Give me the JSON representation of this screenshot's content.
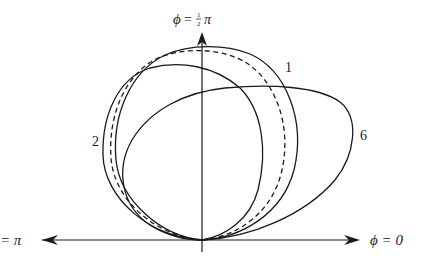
{
  "figure": {
    "type": "polar-radiation-pattern",
    "axes": {
      "vertical_label": "ϕ = ½ π",
      "vertical_label_parts": {
        "symbol": "ϕ",
        "eq": "=",
        "num": "1",
        "den": "2",
        "pi": "π"
      },
      "right_label": "ϕ = 0",
      "left_label": "= π"
    },
    "curve_labels": {
      "curve_1": "1",
      "curve_2": "2",
      "curve_6": "6"
    },
    "curves": [
      {
        "name": "curve-1",
        "label": "1",
        "style": "solid",
        "description": "circle-like lobe, top near vertical axis, right extent ~x=298"
      },
      {
        "name": "curve-dashed",
        "label": "",
        "style": "dashed",
        "description": "intermediate lobe between curves 1 and 2"
      },
      {
        "name": "curve-2",
        "label": "2",
        "style": "solid",
        "description": "lobe tilted to the left"
      },
      {
        "name": "curve-6",
        "label": "6",
        "style": "solid",
        "description": "wide lobe extending far to the right"
      }
    ],
    "colors": {
      "ink": "#1a1a1a",
      "background": "#ffffff"
    }
  }
}
